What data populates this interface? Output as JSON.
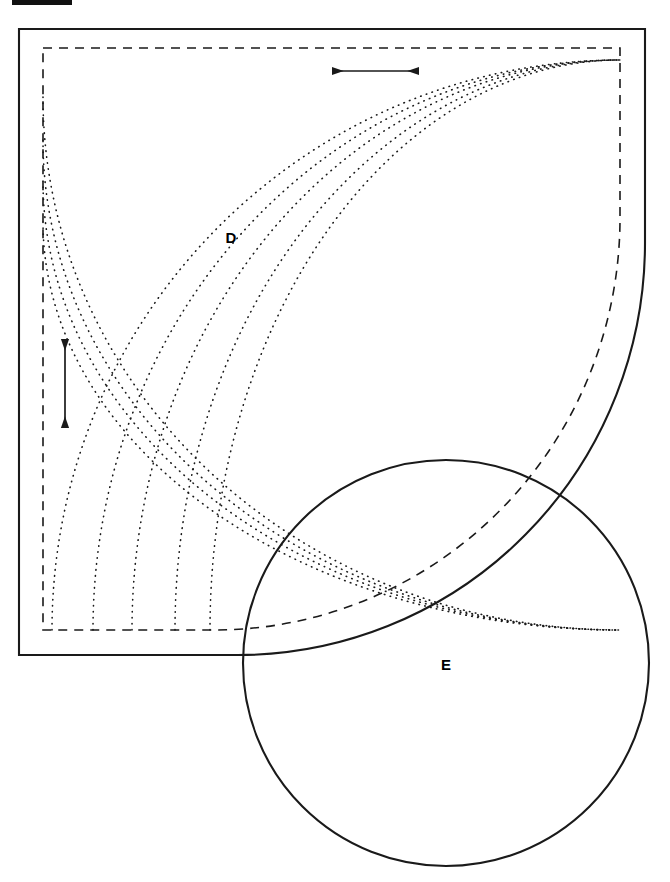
{
  "figure": {
    "kind": "engineering-line-drawing",
    "width": 670,
    "height": 882,
    "background_color": "#ffffff",
    "stroke_color": "#1a1a1a",
    "labels": [
      {
        "id": "D",
        "text": "D",
        "x": 231,
        "y": 237,
        "style": "bold"
      },
      {
        "id": "E",
        "text": "E",
        "x": 446,
        "y": 664,
        "style": "bold"
      }
    ],
    "top_marker": {
      "name": "crop-bar",
      "x": 12,
      "y": 0,
      "width": 60,
      "height": 5,
      "color": "#111111"
    },
    "outer_shape": {
      "name": "outer-solid-profile",
      "left": 19,
      "top": 29,
      "right": 645,
      "bottom": 655,
      "stroke_width": 2.1,
      "style": "solid",
      "corner_arc": {
        "from_x": 238,
        "from_y": 655,
        "to_x": 645,
        "to_y": 243,
        "rx": 407,
        "ry": 412,
        "sweep": 1
      }
    },
    "inner_shape": {
      "name": "inner-dashed-profile",
      "left": 43,
      "top": 48,
      "right": 620,
      "bottom": 630,
      "stroke_width": 1.6,
      "style": "dashed",
      "dash_pattern": "9 7",
      "corner_arc": {
        "from_x": 214,
        "from_y": 630,
        "to_x": 620,
        "to_y": 218,
        "rx": 406,
        "ry": 412,
        "sweep": 1
      }
    },
    "dotted_arcs": {
      "name": "concentric-dotted-arcs",
      "count": 9,
      "style": "dotted",
      "stroke_width": 1.6,
      "dash_pattern": "0.5 5.5",
      "center_x": 620,
      "center_y": 630,
      "arcs": [
        {
          "index": 1,
          "x_end": 52,
          "y_end": 60,
          "rx": 568,
          "ry": 570
        },
        {
          "index": 2,
          "x_end": 93,
          "y_end": 60,
          "rx": 527,
          "ry": 570
        },
        {
          "index": 3,
          "x_end": 132,
          "y_end": 60,
          "rx": 488,
          "ry": 570
        },
        {
          "index": 4,
          "x_end": 175,
          "y_end": 60,
          "rx": 445,
          "ry": 570
        },
        {
          "index": 5,
          "x_end": 210,
          "y_end": 60,
          "rx": 410,
          "ry": 570
        },
        {
          "index": 6,
          "x_end": 43,
          "y_end": 97,
          "rx": 577,
          "ry": 533
        },
        {
          "index": 7,
          "x_end": 43,
          "y_end": 140,
          "rx": 577,
          "ry": 490
        },
        {
          "index": 8,
          "x_end": 43,
          "y_end": 181,
          "rx": 577,
          "ry": 449
        },
        {
          "index": 9,
          "x_end": 43,
          "y_end": 222,
          "rx": 577,
          "ry": 408
        }
      ]
    },
    "circle_e": {
      "name": "circle-e",
      "center_x": 446,
      "center_y": 663,
      "radius": 203,
      "stroke_width": 2.1,
      "style": "solid",
      "fill": "none"
    },
    "dimension_arrows": [
      {
        "id": "horizontal-dimension",
        "orientation": "horizontal",
        "x1": 331,
        "y1": 71,
        "x2": 420,
        "y2": 71,
        "heads": "both",
        "stroke_width": 1.7
      },
      {
        "id": "vertical-dimension",
        "orientation": "vertical",
        "x1": 65,
        "y1": 337,
        "x2": 65,
        "y2": 430,
        "heads": "both",
        "stroke_width": 1.7
      }
    ]
  }
}
